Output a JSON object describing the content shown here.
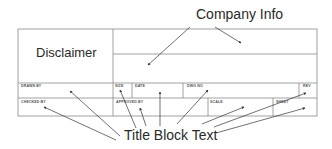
{
  "diagram": {
    "callouts": {
      "company_info": "Company Info",
      "title_block_text": "Title Block Text"
    },
    "disclaimer": "Disclaimer",
    "cells": {
      "drawn_by": "DRAWN BY",
      "size": "SIZE",
      "date": "DATE",
      "dwg_no": "DWG NO",
      "rev": "REV",
      "checked_by": "CHECKED BY",
      "approved_by": "APPROVED BY",
      "scale": "SCALE",
      "sheet": "SHEET"
    },
    "colors": {
      "border": "#8a8a8a",
      "arrow": "#333333",
      "text": "#2a2a2a"
    }
  }
}
